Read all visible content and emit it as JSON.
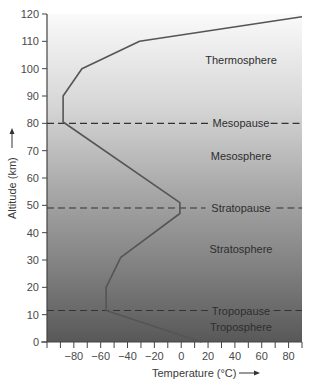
{
  "chart_data": {
    "type": "line",
    "title": "",
    "xlabel": "Temperature (°C)",
    "ylabel": "Altitude (km)",
    "xlim": [
      -100,
      90
    ],
    "ylim": [
      0,
      120
    ],
    "x_ticks": [
      -80,
      -60,
      -40,
      -20,
      0,
      20,
      40,
      60,
      80
    ],
    "x_minor_ticks": [
      -100,
      -90,
      -80,
      -70,
      -60,
      -50,
      -40,
      -30,
      -20,
      -10,
      0,
      10,
      20,
      30,
      40,
      50,
      60,
      70,
      80,
      90
    ],
    "y_ticks": [
      0,
      10,
      20,
      30,
      40,
      50,
      60,
      70,
      80,
      90,
      100,
      110,
      120
    ],
    "grid": false,
    "series": [
      {
        "name": "Temperature profile",
        "points": [
          {
            "t": 15,
            "alt": 0
          },
          {
            "t": -56,
            "alt": 11.5
          },
          {
            "t": -56,
            "alt": 20
          },
          {
            "t": -45,
            "alt": 31
          },
          {
            "t": -1,
            "alt": 47
          },
          {
            "t": -1,
            "alt": 51
          },
          {
            "t": -88,
            "alt": 80.5
          },
          {
            "t": -88,
            "alt": 90
          },
          {
            "t": -74,
            "alt": 100
          },
          {
            "t": -31,
            "alt": 110
          },
          {
            "t": 90,
            "alt": 119
          }
        ]
      }
    ],
    "boundaries": [
      {
        "name": "Tropopause",
        "alt": 11.5
      },
      {
        "name": "Stratopause",
        "alt": 49
      },
      {
        "name": "Mesopause",
        "alt": 80
      }
    ],
    "layers": [
      {
        "name": "Troposphere",
        "alt": 5.5
      },
      {
        "name": "Stratosphere",
        "alt": 34
      },
      {
        "name": "Mesosphere",
        "alt": 68
      },
      {
        "name": "Thermosphere",
        "alt": 103
      }
    ]
  },
  "labels": {
    "xlabel": "Temperature (°C)",
    "ylabel": "Altitude (km)",
    "tropopause": "Tropopause",
    "stratopause": "Stratopause",
    "mesopause": "Mesopause",
    "troposphere": "Troposphere",
    "stratosphere": "Stratosphere",
    "mesosphere": "Mesosphere",
    "thermosphere": "Thermosphere"
  },
  "colors": {
    "gradient_top": "#fbfbfb",
    "gradient_mid": "#bdbdbd",
    "gradient_bottom": "#5a5a5a",
    "curve": "#555555",
    "dash": "#333333",
    "axis": "#444444"
  }
}
